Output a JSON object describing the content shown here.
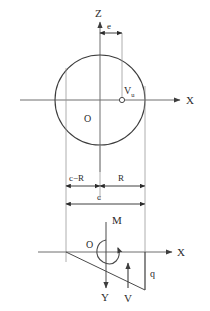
{
  "diagram": {
    "colors": {
      "outline": "#3d3d3d",
      "thin_line": "#8c8c8c",
      "dimension": "#2b2b2b",
      "axis": "#6e6e6e",
      "text": "#2b2b2b",
      "background": "#ffffff"
    },
    "upper": {
      "axis_z_label": "Z",
      "axis_x_label": "X",
      "center_label": "O",
      "load_point_label": "V",
      "load_point_sub": "u",
      "eccentricity_label": "e",
      "circle": {
        "cx": 100,
        "cy": 100,
        "r": 45
      },
      "load_point": {
        "x": 122,
        "y": 100
      }
    },
    "dimensions": {
      "left_label": "c−R",
      "right_label": "R",
      "total_label": "c"
    },
    "lower": {
      "origin_label": "O",
      "axis_x_label": "X",
      "axis_y_label": "Y",
      "moment_label": "M",
      "shear_label": "V",
      "load_label": "q"
    }
  }
}
